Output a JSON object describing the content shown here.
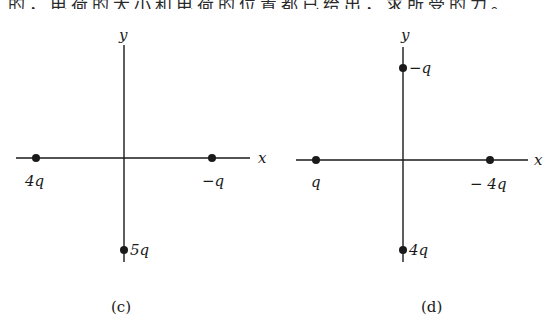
{
  "header": {
    "clipped_text": "的，电荷的大小和电荷的位置都已给出，求所受的力。"
  },
  "figures": [
    {
      "id": "c",
      "caption": "(c)",
      "axes": {
        "x_label": "x",
        "y_label": "y"
      },
      "charges": [
        {
          "label": "4q",
          "position": "negative x-axis"
        },
        {
          "label": "−q",
          "position": "positive x-axis"
        },
        {
          "label": "5q",
          "position": "negative y-axis"
        }
      ]
    },
    {
      "id": "d",
      "caption": "(d)",
      "axes": {
        "x_label": "x",
        "y_label": "y"
      },
      "charges": [
        {
          "label": "−q",
          "position": "positive y-axis"
        },
        {
          "label": "q",
          "position": "negative x-axis"
        },
        {
          "label": "− 4q",
          "position": "positive x-axis"
        },
        {
          "label": "4q",
          "position": "negative y-axis"
        }
      ]
    }
  ],
  "colors": {
    "ink": "#1a1a1a",
    "background": "#ffffff"
  }
}
